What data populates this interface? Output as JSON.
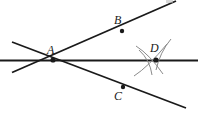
{
  "figure": {
    "type": "geometry-diagram",
    "width": 198,
    "height": 114,
    "background_color": "#ffffff",
    "line_color": "#1a1a1a",
    "arc_color": "#8a8a8a",
    "dot_color": "#1a1a1a"
  },
  "points": [
    {
      "name": "A",
      "label": "A",
      "x": 53,
      "y": 60,
      "label_x": 47,
      "label_y": 44,
      "dot": true,
      "dot_radius": 2.6
    },
    {
      "name": "B",
      "label": "B",
      "x": 122,
      "y": 31,
      "label_x": 114,
      "label_y": 14,
      "dot": true,
      "dot_radius": 2.2
    },
    {
      "name": "C",
      "label": "C",
      "x": 123,
      "y": 87,
      "label_x": 114,
      "label_y": 90,
      "dot": true,
      "dot_radius": 2.2
    },
    {
      "name": "D",
      "label": "D",
      "x": 156,
      "y": 60,
      "label_x": 150,
      "label_y": 42,
      "dot": true,
      "dot_radius": 2.6
    }
  ],
  "lines": [
    {
      "name": "horizontal-line",
      "x1": 0,
      "y1": 60.5,
      "x2": 198,
      "y2": 60.5,
      "width": 2.0
    },
    {
      "name": "ascending-line-through-B",
      "x1": 12,
      "y1": 72.5,
      "x2": 176,
      "y2": 1,
      "width": 1.8
    },
    {
      "name": "descending-line-through-C",
      "x1": 12,
      "y1": 42,
      "x2": 186,
      "y2": 108,
      "width": 1.8
    }
  ],
  "arcs": [
    {
      "name": "construction-arc-upper-left",
      "d": "M 136 46 Q 150 55 163 74",
      "width": 1.0
    },
    {
      "name": "construction-arc-lower-left",
      "d": "M 134 76 Q 148 67 167 44",
      "width": 1.0
    },
    {
      "name": "construction-arc-right-upper",
      "d": "M 171 39 Q 160 52 156 70",
      "width": 1.0
    },
    {
      "name": "construction-arc-left-sweep",
      "d": "M 139 50 Q 150 60 152 75",
      "width": 1.0
    }
  ],
  "edge_artifact": {
    "name": "clipped-top-label",
    "x": 166,
    "y": 0,
    "width": 7,
    "height": 3,
    "color": "#b8b8b8"
  }
}
